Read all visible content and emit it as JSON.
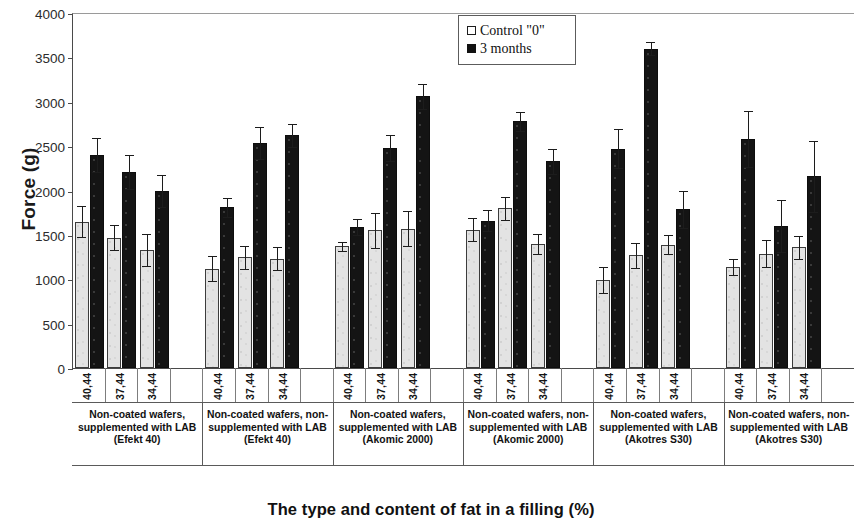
{
  "chart_data": {
    "type": "bar",
    "title": "",
    "xlabel": "The type and content of fat in a filling (%)",
    "ylabel": "Force (g)",
    "ylim": [
      0,
      4000
    ],
    "ytick_step": 500,
    "yticks": [
      "0",
      "500",
      "1000",
      "1500",
      "2000",
      "2500",
      "3000",
      "3500",
      "4000"
    ],
    "grid": false,
    "legend_position": "top-center",
    "legend": [
      "Control \"0\"",
      "3 months"
    ],
    "series_colors": {
      "control": "#e3e3e3",
      "months": "#141414"
    },
    "categories": [
      "40,44",
      "37,44",
      "34,44"
    ],
    "groups": [
      {
        "label": "Non-coated wafers, supplemented with LAB (Efekt 40)",
        "categories": [
          "40,44",
          "37,44",
          "34,44"
        ],
        "control": [
          1650,
          1470,
          1330
        ],
        "control_err": [
          170,
          140,
          180
        ],
        "months": [
          2400,
          2210,
          1990
        ],
        "months_err": [
          190,
          190,
          180
        ]
      },
      {
        "label": "Non-coated wafers, non-supplemented with LAB (Efekt 40)",
        "categories": [
          "40,44",
          "37,44",
          "34,44"
        ],
        "control": [
          1120,
          1250,
          1230
        ],
        "control_err": [
          140,
          130,
          130
        ],
        "months": [
          1810,
          2530,
          2620
        ],
        "months_err": [
          110,
          180,
          130
        ]
      },
      {
        "label": "Non-coated wafers, supplemented with LAB (Akomic 2000)",
        "categories": [
          "40,44",
          "37,44",
          "34,44"
        ],
        "control": [
          1370,
          1550,
          1570
        ],
        "control_err": [
          50,
          200,
          200
        ],
        "months": [
          1590,
          2480,
          3060
        ],
        "months_err": [
          90,
          150,
          140
        ]
      },
      {
        "label": "Non-coated wafers, non-supplemented with LAB (Akomic 2000)",
        "categories": [
          "40,44",
          "37,44",
          "34,44"
        ],
        "control": [
          1560,
          1800,
          1400
        ],
        "control_err": [
          130,
          130,
          110
        ],
        "months": [
          1660,
          2780,
          2330
        ],
        "months_err": [
          120,
          110,
          140
        ]
      },
      {
        "label": "Non-coated wafers, supplemented with LAB (Akotres S30)",
        "categories": [
          "40,44",
          "37,44",
          "34,44"
        ],
        "control": [
          990,
          1270,
          1390
        ],
        "control_err": [
          150,
          140,
          110
        ],
        "months": [
          2470,
          3600,
          1790
        ],
        "months_err": [
          220,
          70,
          210
        ]
      },
      {
        "label": "Non-coated wafers, non-supplemented with LAB (Akotres S30)",
        "categories": [
          "40,44",
          "37,44",
          "34,44"
        ],
        "control": [
          1140,
          1290,
          1360
        ],
        "control_err": [
          90,
          150,
          130
        ],
        "months": [
          2580,
          1600,
          2160
        ],
        "months_err": [
          320,
          290,
          400
        ]
      }
    ]
  }
}
